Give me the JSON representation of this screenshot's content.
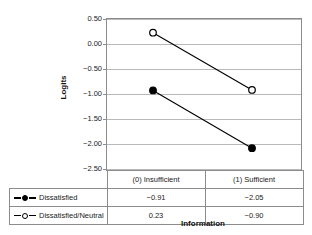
{
  "chart_data": {
    "type": "line",
    "title": "",
    "xlabel": "Information",
    "ylabel": "Logits",
    "categories": [
      "(0) Insufficient",
      "(1) Sufficient"
    ],
    "series": [
      {
        "name": "Dissatisfied",
        "marker": "filled-circle",
        "values": [
          -0.91,
          -2.05
        ],
        "labels": [
          "−0.91",
          "−2.05"
        ]
      },
      {
        "name": "Dissatisfied/Neutral",
        "marker": "open-circle",
        "values": [
          0.23,
          -0.9
        ],
        "labels": [
          "0.23",
          "−0.90"
        ]
      }
    ],
    "ylim": [
      -2.5,
      0.5
    ],
    "ytick_values": [
      0.5,
      0.0,
      -0.5,
      -1.0,
      -1.5,
      -2.0,
      -2.5
    ],
    "ytick_labels": [
      "0.50",
      "0.00",
      "−0.50",
      "−1.00",
      "−1.50",
      "−2.00",
      "−2.50"
    ],
    "grid": true,
    "legend_position": "table-left-column",
    "colors": {
      "line": "#000000",
      "grid": "#b9b9b9",
      "axis": "#8c8c8c",
      "text": "#1a1a1a"
    }
  },
  "table": {
    "header": [
      "",
      "(0) Insufficient",
      "(1) Sufficient"
    ],
    "rows": [
      {
        "label": "Dissatisfied",
        "marker": "filled-circle",
        "cells": [
          "−0.91",
          "−2.05"
        ]
      },
      {
        "label": "Dissatisfied/Neutral",
        "marker": "open-circle",
        "cells": [
          "0.23",
          "−0.90"
        ]
      }
    ]
  }
}
